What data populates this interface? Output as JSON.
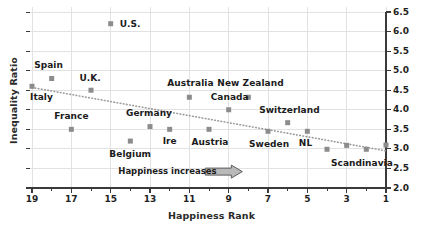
{
  "chart_data": {
    "type": "scatter",
    "title": "",
    "xlabel": "Happiness Rank",
    "ylabel": "Inequality Ratio",
    "xlim": [
      19.5,
      0.5
    ],
    "ylim": [
      2.0,
      6.5
    ],
    "x_axis_inverted": true,
    "grid": true,
    "legend": "none",
    "x_ticks_major": [
      "19",
      "17",
      "15",
      "13",
      "11",
      "9",
      "7",
      "5",
      "3",
      "1"
    ],
    "x_ticks_major_values": [
      19,
      17,
      15,
      13,
      11,
      9,
      7,
      5,
      3,
      1
    ],
    "x_ticks_minor_values": [
      18,
      16,
      14,
      12,
      10,
      8,
      6,
      4,
      2
    ],
    "y_ticks": [
      "2.0",
      "2.5",
      "3.0",
      "3.5",
      "4.0",
      "4.5",
      "5.0",
      "5.5",
      "6.0",
      "6.5"
    ],
    "y_ticks_values": [
      2.0,
      2.5,
      3.0,
      3.5,
      4.0,
      4.5,
      5.0,
      5.5,
      6.0,
      6.5
    ],
    "y_axis_position": "right",
    "marker_color": "#8c8c8c",
    "axis_color": "#3a3a3a",
    "grid_color": "#e2e2e2",
    "trend_color": "#9a9a9a",
    "points": [
      {
        "label": "Italy",
        "x": 19,
        "y": 4.6,
        "label_dx": -2,
        "label_dy": 11,
        "label_align": "left"
      },
      {
        "label": "Spain",
        "x": 18,
        "y": 4.8,
        "label_dx": -3,
        "label_dy": -13,
        "label_align": "center"
      },
      {
        "label": "France",
        "x": 17,
        "y": 3.5,
        "label_dx": 0,
        "label_dy": -13,
        "label_align": "center"
      },
      {
        "label": "U.K.",
        "x": 16,
        "y": 4.5,
        "label_dx": -1,
        "label_dy": -12,
        "label_align": "center"
      },
      {
        "label": "U.S.",
        "x": 15,
        "y": 6.2,
        "label_dx": 9,
        "label_dy": 0,
        "label_align": "left"
      },
      {
        "label": "Belgium",
        "x": 14,
        "y": 3.2,
        "label_dx": 0,
        "label_dy": 13,
        "label_align": "center"
      },
      {
        "label": "Germany",
        "x": 13,
        "y": 3.57,
        "label_dx": -1,
        "label_dy": -14,
        "label_align": "center"
      },
      {
        "label": "Ire",
        "x": 12,
        "y": 3.5,
        "label_dx": 0,
        "label_dy": 12,
        "label_align": "center"
      },
      {
        "label": "Australia",
        "x": 11,
        "y": 4.32,
        "label_dx": 1,
        "label_dy": -14,
        "label_align": "center"
      },
      {
        "label": "Austria",
        "x": 10,
        "y": 3.5,
        "label_dx": 1,
        "label_dy": 13,
        "label_align": "center"
      },
      {
        "label": "Canada",
        "x": 9,
        "y": 4.0,
        "label_dx": 1,
        "label_dy": -13,
        "label_align": "center"
      },
      {
        "label": "New Zealand",
        "x": 8,
        "y": 4.32,
        "label_dx": 2,
        "label_dy": -14,
        "label_align": "center"
      },
      {
        "label": "Sweden",
        "x": 7,
        "y": 3.45,
        "label_dx": 1,
        "label_dy": 13,
        "label_align": "center"
      },
      {
        "label": "Switzerland",
        "x": 6,
        "y": 3.67,
        "label_dx": 2,
        "label_dy": -13,
        "label_align": "center"
      },
      {
        "label": "NL",
        "x": 5,
        "y": 3.45,
        "label_dx": -2,
        "label_dy": 12,
        "label_align": "center"
      },
      {
        "label": "Scandinavia",
        "x": 4,
        "y": 2.99,
        "label_dx": 0,
        "label_dy": 0,
        "label_align": "none"
      },
      {
        "label": "",
        "x": 3,
        "y": 3.09,
        "label_dx": 0,
        "label_dy": 0,
        "label_align": "none"
      },
      {
        "label": "",
        "x": 2,
        "y": 2.99,
        "label_dx": 0,
        "label_dy": 0,
        "label_align": "none"
      },
      {
        "label": "",
        "x": 1,
        "y": 3.1,
        "label_dx": 0,
        "label_dy": 0,
        "label_align": "none"
      }
    ],
    "scandinavia_label": "Scandinavia",
    "trendline": {
      "x0": 19,
      "y0": 4.57,
      "x1": 1,
      "y1": 2.95,
      "style": "dotted"
    },
    "annotation": {
      "text": "Happiness  increases",
      "arrow": "right-block-arrow",
      "x": 10.8,
      "y": 2.42
    }
  }
}
